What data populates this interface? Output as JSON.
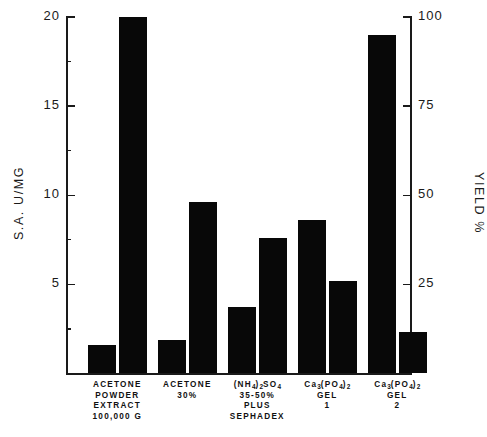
{
  "chart_data": {
    "type": "bar",
    "title": "",
    "subtitle": "",
    "categories": [
      "ACETONE POWDER EXTRACT 100,000 G",
      "ACETONE 30%",
      "(NH4)2SO4 35-50% PLUS SEPHADEX",
      "Ca3(PO4)2 GEL 1",
      "Ca3(PO4)2 GEL 2"
    ],
    "category_label_lines": [
      [
        "ACETONE",
        "POWDER",
        "EXTRACT",
        "100,000 G"
      ],
      [
        "ACETONE",
        "30%"
      ],
      [
        "(NH4)2SO4",
        "35-50%",
        "PLUS",
        "SEPHADEX"
      ],
      [
        "Ca3(PO4)2",
        "GEL",
        "1"
      ],
      [
        "Ca3(PO4)2",
        "GEL",
        "2"
      ]
    ],
    "series": [
      {
        "name": "S.A. U/MG",
        "axis": "left",
        "values": [
          1.6,
          1.9,
          3.7,
          8.6,
          19.0
        ]
      },
      {
        "name": "YIELD %",
        "axis": "right",
        "values": [
          100,
          48,
          38,
          26,
          11.5
        ]
      }
    ],
    "xlabel": "",
    "ylabel_left": "S.A. U/MG",
    "ylabel_right": "YIELD %",
    "ylim_left": [
      0,
      20
    ],
    "ylim_right": [
      0,
      100
    ],
    "yticks_left": [
      5,
      10,
      15,
      20
    ],
    "yticks_left_minor": [
      2.5,
      7.5,
      12.5,
      17.5
    ],
    "yticks_right": [
      25,
      50,
      75,
      100
    ],
    "ytick_labels_left": [
      "5",
      "10",
      "15",
      "20"
    ],
    "ytick_labels_right": [
      "25",
      "50",
      "75",
      "100"
    ],
    "grid": false,
    "legend": "none",
    "bar_color": "#080808"
  },
  "axes": {
    "left_title": "S.A.  U/MG",
    "right_title": "YIELD  %"
  }
}
